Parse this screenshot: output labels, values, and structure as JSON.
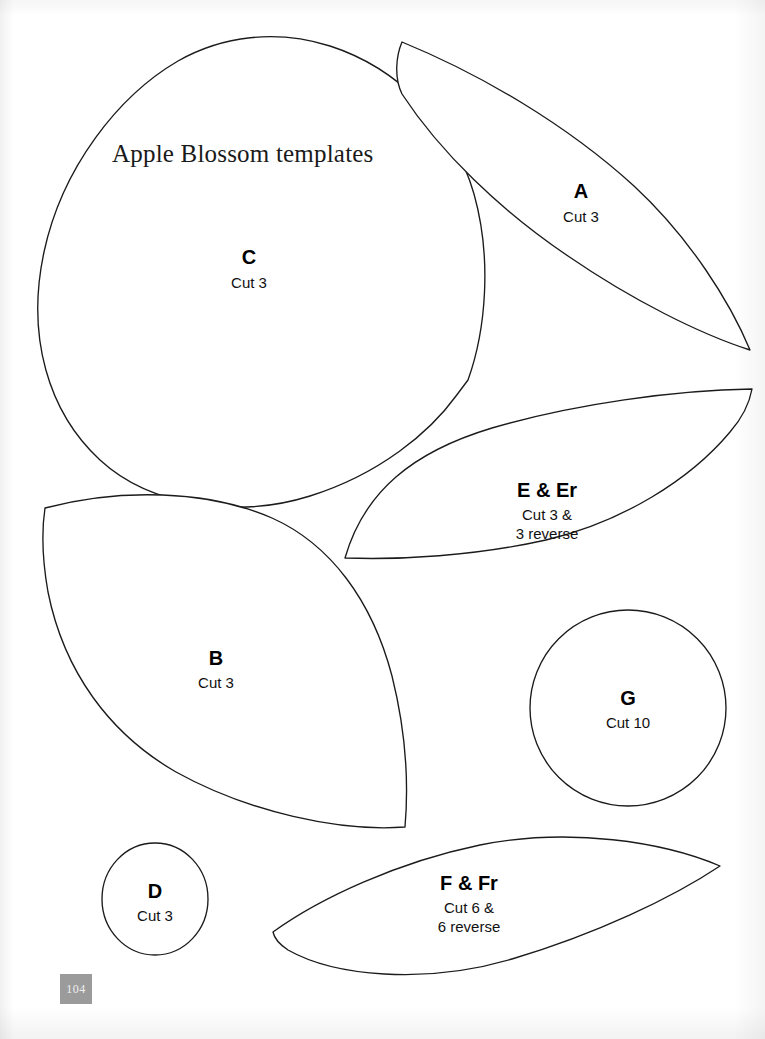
{
  "page": {
    "title": "Apple Blossom templates",
    "page_number": "104",
    "background_color": "#ffffff",
    "outline_color": "#1b1b1b",
    "page_number_badge_color": "#9b9b9b",
    "page_number_text_color": "#efefef"
  },
  "templates": [
    {
      "id": "c",
      "letter": "C",
      "cut_lines": [
        "Cut 3"
      ],
      "shape": "large-rounded-petal"
    },
    {
      "id": "a",
      "letter": "A",
      "cut_lines": [
        "Cut 3"
      ],
      "shape": "leaf-pointed"
    },
    {
      "id": "e",
      "letter": "E & Er",
      "cut_lines": [
        "Cut 3 &",
        "3 reverse"
      ],
      "shape": "leaf-pointed"
    },
    {
      "id": "b",
      "letter": "B",
      "cut_lines": [
        "Cut 3"
      ],
      "shape": "large-leaf"
    },
    {
      "id": "g",
      "letter": "G",
      "cut_lines": [
        "Cut 10"
      ],
      "shape": "circle"
    },
    {
      "id": "d",
      "letter": "D",
      "cut_lines": [
        "Cut 3"
      ],
      "shape": "small-circle"
    },
    {
      "id": "f",
      "letter": "F & Fr",
      "cut_lines": [
        "Cut 6 &",
        "6 reverse"
      ],
      "shape": "slim-leaf"
    }
  ]
}
